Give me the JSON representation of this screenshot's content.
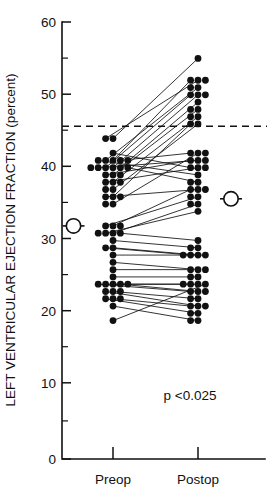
{
  "chart_data": {
    "type": "scatter",
    "subtype": "paired-dot-plot",
    "title": "",
    "xlabel": "",
    "ylabel": "LEFT VENTRICULAR EJECTION FRACTION (percent)",
    "categories": [
      "Preop",
      "Postop"
    ],
    "ylim": [
      0,
      60
    ],
    "yticks": [
      0,
      10,
      20,
      30,
      40,
      50,
      60
    ],
    "ytick_labels": [
      "0",
      "10",
      "20",
      "30",
      "40",
      "50",
      "60"
    ],
    "yticks_minor": [
      5,
      15,
      25,
      35,
      45,
      55
    ],
    "grid": false,
    "legend": "none",
    "reference_line": {
      "value": 45,
      "style": "dashed",
      "label": ""
    },
    "annotations": [
      {
        "text": "p <0.025",
        "x_category": "Postop",
        "y": 9.5
      }
    ],
    "series": [
      {
        "name": "Paired patients",
        "pairs": [
          {
            "preop": 44,
            "postop": 55
          },
          {
            "preop": 44,
            "postop": 52
          },
          {
            "preop": 41,
            "postop": 52
          },
          {
            "preop": 41,
            "postop": 51
          },
          {
            "preop": 40,
            "postop": 50
          },
          {
            "preop": 40,
            "postop": 50
          },
          {
            "preop": 40,
            "postop": 49
          },
          {
            "preop": 39,
            "postop": 48
          },
          {
            "preop": 38,
            "postop": 47
          },
          {
            "preop": 37,
            "postop": 46
          },
          {
            "preop": 36,
            "postop": 46
          },
          {
            "preop": 35,
            "postop": 42
          },
          {
            "preop": 41,
            "postop": 42
          },
          {
            "preop": 40,
            "postop": 41
          },
          {
            "preop": 39,
            "postop": 41
          },
          {
            "preop": 38,
            "postop": 40
          },
          {
            "preop": 42,
            "postop": 40
          },
          {
            "preop": 41,
            "postop": 39
          },
          {
            "preop": 40,
            "postop": 38
          },
          {
            "preop": 36,
            "postop": 37
          },
          {
            "preop": 32,
            "postop": 37
          },
          {
            "preop": 32,
            "postop": 36
          },
          {
            "preop": 31,
            "postop": 35
          },
          {
            "preop": 31,
            "postop": 34
          },
          {
            "preop": 31,
            "postop": 30
          },
          {
            "preop": 30,
            "postop": 29
          },
          {
            "preop": 29,
            "postop": 28
          },
          {
            "preop": 29,
            "postop": 28
          },
          {
            "preop": 28,
            "postop": 28
          },
          {
            "preop": 27,
            "postop": 26
          },
          {
            "preop": 26,
            "postop": 26
          },
          {
            "preop": 25,
            "postop": 25
          },
          {
            "preop": 24,
            "postop": 24
          },
          {
            "preop": 24,
            "postop": 24
          },
          {
            "preop": 24,
            "postop": 23
          },
          {
            "preop": 24,
            "postop": 23
          },
          {
            "preop": 23,
            "postop": 22
          },
          {
            "preop": 23,
            "postop": 21
          },
          {
            "preop": 22,
            "postop": 21
          },
          {
            "preop": 22,
            "postop": 20
          },
          {
            "preop": 21,
            "postop": 19
          },
          {
            "preop": 19,
            "postop": 24
          }
        ]
      }
    ],
    "extra_points": {
      "preop": [
        40,
        41,
        39,
        38,
        37,
        36,
        35,
        32,
        31,
        24,
        23,
        22
      ],
      "postop": [
        52,
        51,
        50,
        48,
        47,
        42,
        41,
        40,
        38,
        37,
        36,
        35,
        29,
        28,
        26,
        25,
        24,
        23,
        22,
        21,
        20,
        19
      ]
    },
    "means": [
      {
        "category": "Preop",
        "value": 32.3,
        "marker": "circle-with-bar"
      },
      {
        "category": "Postop",
        "value": 36.0,
        "marker": "circle-with-bar"
      }
    ]
  },
  "colors": {
    "ink": "#111111",
    "background": "#ffffff"
  }
}
